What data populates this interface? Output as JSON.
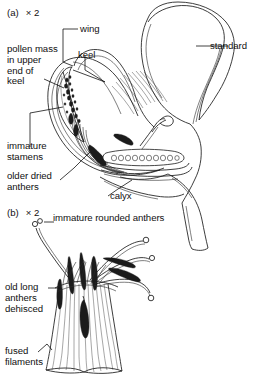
{
  "figure": {
    "width": 257,
    "height": 386,
    "background_color": "#ffffff",
    "ink_color": "#1b1b1b",
    "caption_text_color": "#101010",
    "style": "black-and-white line drawing"
  },
  "panels": [
    {
      "id": "a",
      "tag": "(a)",
      "magnification": "× 2",
      "tag_full": "(a)  × 2",
      "description": "longitudinal section of a papilionaceous flower"
    },
    {
      "id": "b",
      "tag": "(b)",
      "magnification": "× 2",
      "tag_full": "(b)  × 2",
      "description": "stamen column with anthers of two ages"
    }
  ],
  "labels_panel_a": [
    {
      "name": "wing",
      "text": "wing"
    },
    {
      "name": "keel",
      "text": "keel"
    },
    {
      "name": "standard",
      "text": "standard"
    },
    {
      "name": "pollen-mass",
      "text": "pollen mass\nin upper\nend of\nkeel"
    },
    {
      "name": "immature-stamens",
      "text": "immature\nstamens"
    },
    {
      "name": "older-dried-anthers",
      "text": "older dried\nanthers"
    },
    {
      "name": "calyx",
      "text": "calyx"
    }
  ],
  "labels_panel_b": [
    {
      "name": "immature-rounded-anthers",
      "text": "immature rounded anthers"
    },
    {
      "name": "old-long-anthers-dehisced",
      "text": "old long\nanthers\ndehisced"
    },
    {
      "name": "fused-filaments",
      "text": "fused\nfilaments"
    }
  ],
  "label_text": {
    "wing": "wing",
    "keel": "keel",
    "standard": "standard",
    "pollen_mass_l1": "pollen mass",
    "pollen_mass_l2": "in upper",
    "pollen_mass_l3": "end of",
    "pollen_mass_l4": "keel",
    "immature_stamens_l1": "immature",
    "immature_stamens_l2": "stamens",
    "older_dried_l1": "older dried",
    "older_dried_l2": "anthers",
    "calyx": "calyx",
    "immature_rounded_anthers": "immature rounded anthers",
    "old_long_l1": "old long",
    "old_long_l2": "anthers",
    "old_long_l3": "dehisced",
    "fused_l1": "fused",
    "fused_l2": "filaments",
    "panel_a_tag": "(a)",
    "panel_a_mag": "× 2",
    "panel_b_tag": "(b)",
    "panel_b_mag": "× 2"
  }
}
